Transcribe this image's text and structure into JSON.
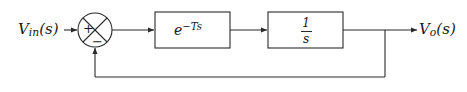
{
  "diagram": {
    "stroke_color": "#2a2a2a",
    "text_color": "#1a1a1a",
    "background": "#ffffff",
    "input": {
      "label_base": "V",
      "label_sub": "in",
      "label_arg": "(s)",
      "full_label": "V_in(s)"
    },
    "output": {
      "label_base": "V",
      "label_sub": "o",
      "label_arg": "(s)",
      "full_label": "V_o(s)"
    },
    "summing_junction": {
      "name": "summing-junction",
      "shape": "circle-with-cross",
      "plus_sign": "+",
      "minus_sign": "−",
      "center_x": 95,
      "center_y": 30,
      "radius": 17
    },
    "blocks": [
      {
        "id": "delay-block",
        "label_base": "e",
        "label_exponent": "−Ts",
        "full_label": "e^(-Ts)",
        "x": 155,
        "y": 12,
        "width": 75,
        "height": 36
      },
      {
        "id": "integrator-block",
        "numerator": "1",
        "denominator": "s",
        "full_label": "1/s",
        "x": 268,
        "y": 12,
        "width": 75,
        "height": 36
      }
    ],
    "feedback": {
      "name": "unity-feedback-path",
      "gain": "1",
      "tap_x": 385,
      "bottom_y": 77
    }
  }
}
